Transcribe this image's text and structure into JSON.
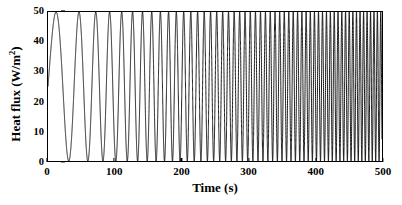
{
  "chart_data": {
    "type": "line",
    "title": "",
    "subtitle": "",
    "xlabel": "Time (s)",
    "ylabel_text": "Heat flux (W/m",
    "ylabel_sup": "2",
    "ylabel_tail": ")",
    "ylabel_full": "Heat flux (W/m2)",
    "xlim": [
      0,
      500
    ],
    "ylim": [
      0,
      50
    ],
    "xticks": [
      0,
      100,
      200,
      300,
      400,
      500
    ],
    "xtick_labels": [
      "0",
      "100",
      "200",
      "300",
      "400",
      "500"
    ],
    "yticks": [
      0,
      10,
      20,
      30,
      40,
      50
    ],
    "ytick_labels": [
      "0",
      "10",
      "20",
      "30",
      "40",
      "50"
    ],
    "grid": false,
    "legend": null,
    "legend_position": "none",
    "line_color": "#000000",
    "line_width": 1.0,
    "background_color": "#ffffff",
    "frame_color": "#000000",
    "series": [
      {
        "name": "Heat flux",
        "waveform": "chirp",
        "amplitude": 25,
        "offset": 25,
        "value_at_t0": 25,
        "min_value": 0,
        "max_value": 50,
        "f_start_hz": 0.0185,
        "f_end_hz": 0.2,
        "phase_rad": 0,
        "t_start": 0,
        "t_end": 500,
        "samples": 20000
      }
    ]
  }
}
